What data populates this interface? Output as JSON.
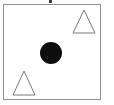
{
  "figure": {
    "title": "Geometric shapes diagram",
    "canvas": {
      "width": 114,
      "height": 105,
      "background_color": "#ffffff"
    },
    "frame": {
      "name": "bounding-box",
      "x": 3,
      "y": 4,
      "width": 98,
      "height": 96,
      "stroke_color": "#8f8f8f",
      "stroke_width": 1,
      "fill_color": "#ffffff"
    },
    "crop_mark": {
      "name": "top-edge-mark",
      "x": 49,
      "y": 0,
      "width": 3,
      "height": 3,
      "color": "#3a3a3a"
    },
    "shapes": [
      {
        "id": "triangle-upper-right",
        "type": "triangle",
        "fill": "none",
        "stroke_color": "#7a7a7a",
        "stroke_width": 1,
        "points": "84,10 95,33 73,33",
        "apex_x": 84,
        "apex_y": 10,
        "base_y": 33,
        "base_left_x": 73,
        "base_right_x": 95
      },
      {
        "id": "circle-center",
        "type": "circle",
        "fill": "#0d0d0d",
        "stroke_color": "none",
        "center_x": 51,
        "center_y": 53,
        "radius": 11,
        "diameter": 22
      },
      {
        "id": "triangle-lower-left",
        "type": "triangle",
        "fill": "none",
        "stroke_color": "#7a7a7a",
        "stroke_width": 1,
        "points": "24,71 35,95 13,95",
        "apex_x": 24,
        "apex_y": 71,
        "base_y": 95,
        "base_left_x": 13,
        "base_right_x": 35
      }
    ],
    "counts": {
      "triangles": 2,
      "circles": 1,
      "total_shapes": 3
    }
  }
}
